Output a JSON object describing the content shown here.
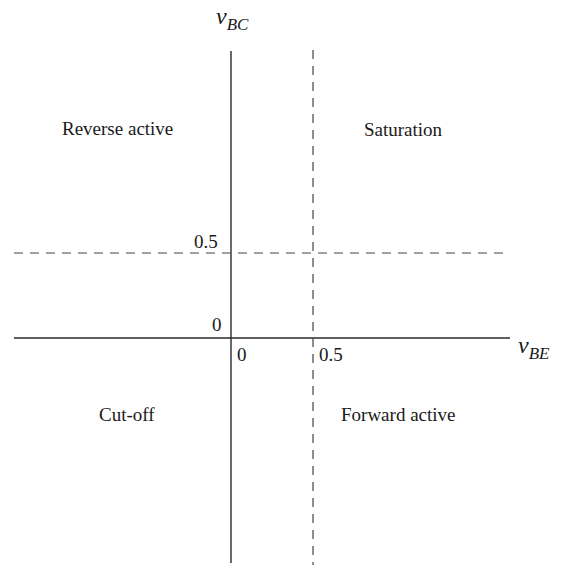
{
  "diagram": {
    "axes": {
      "x": {
        "symbol": "v",
        "subscript": "BE",
        "ticks": [
          "0",
          "0.5"
        ]
      },
      "y": {
        "symbol": "v",
        "subscript": "BC",
        "ticks": [
          "0",
          "0.5"
        ]
      }
    },
    "threshold_lines": {
      "vertical": {
        "value": "0.5",
        "style": "dashed"
      },
      "horizontal": {
        "value": "0.5",
        "style": "dashed"
      }
    },
    "regions": {
      "top_left": "Reverse active",
      "top_right": "Saturation",
      "bottom_left": "Cut-off",
      "bottom_right": "Forward active"
    },
    "colors": {
      "line": "#2a2a2a",
      "text": "#1a1a1a",
      "background": "#ffffff"
    }
  }
}
